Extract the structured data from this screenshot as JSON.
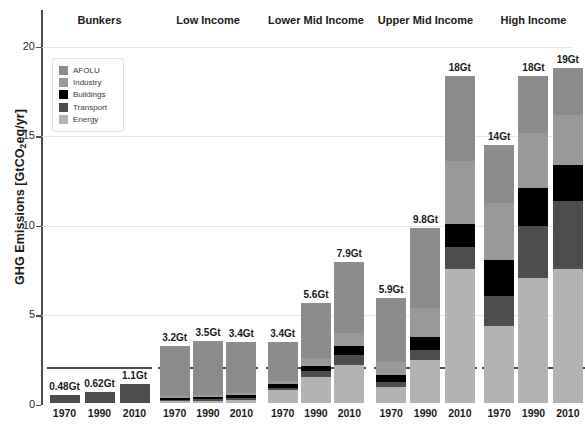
{
  "chart_data": {
    "type": "bar",
    "subtype": "stacked-grouped",
    "title": "",
    "xlabel": "",
    "ylabel": "GHG Emissions [GtCO2eq/yr]",
    "ylabel_parts": {
      "pre": "GHG Emissions [GtCO",
      "sub": "2",
      "post": "eq/yr]"
    },
    "ylim": [
      0,
      21.5
    ],
    "yticks": [
      0,
      5,
      10,
      15,
      20
    ],
    "ytick_labels": [
      "0",
      "5",
      "10",
      "15",
      "20"
    ],
    "grid": true,
    "legend_position": "upper-left-inside",
    "categories": [
      "1970",
      "1990",
      "2010"
    ],
    "series": [
      {
        "name": "Energy",
        "color": "#b3b3b3"
      },
      {
        "name": "Transport",
        "color": "#4d4d4d"
      },
      {
        "name": "Buildings",
        "color": "#000000"
      },
      {
        "name": "Industry",
        "color": "#999999"
      },
      {
        "name": "AFOLU",
        "color": "#8c8c8c"
      }
    ],
    "groups": [
      {
        "name": "Bunkers",
        "bars": [
          {
            "year": "1970",
            "total_label": "0.48Gt",
            "total": 0.48,
            "segments": [
              {
                "series": "Energy",
                "value": 0.0
              },
              {
                "series": "Transport",
                "value": 0.48
              },
              {
                "series": "Buildings",
                "value": 0.0
              },
              {
                "series": "Industry",
                "value": 0.0
              },
              {
                "series": "AFOLU",
                "value": 0.0
              }
            ]
          },
          {
            "year": "1990",
            "total_label": "0.62Gt",
            "total": 0.62,
            "segments": [
              {
                "series": "Energy",
                "value": 0.0
              },
              {
                "series": "Transport",
                "value": 0.62
              },
              {
                "series": "Buildings",
                "value": 0.0
              },
              {
                "series": "Industry",
                "value": 0.0
              },
              {
                "series": "AFOLU",
                "value": 0.0
              }
            ]
          },
          {
            "year": "2010",
            "total_label": "1.1Gt",
            "total": 1.1,
            "segments": [
              {
                "series": "Energy",
                "value": 0.0
              },
              {
                "series": "Transport",
                "value": 1.1
              },
              {
                "series": "Buildings",
                "value": 0.0
              },
              {
                "series": "Industry",
                "value": 0.0
              },
              {
                "series": "AFOLU",
                "value": 0.0
              }
            ]
          }
        ]
      },
      {
        "name": "Low Income",
        "bars": [
          {
            "year": "1970",
            "total_label": "3.2Gt",
            "total": 3.2,
            "segments": [
              {
                "series": "Energy",
                "value": 0.12
              },
              {
                "series": "Transport",
                "value": 0.08
              },
              {
                "series": "Buildings",
                "value": 0.1
              },
              {
                "series": "Industry",
                "value": 0.1
              },
              {
                "series": "AFOLU",
                "value": 2.8
              }
            ]
          },
          {
            "year": "1990",
            "total_label": "3.5Gt",
            "total": 3.5,
            "segments": [
              {
                "series": "Energy",
                "value": 0.14
              },
              {
                "series": "Transport",
                "value": 0.1
              },
              {
                "series": "Buildings",
                "value": 0.12
              },
              {
                "series": "Industry",
                "value": 0.12
              },
              {
                "series": "AFOLU",
                "value": 3.02
              }
            ]
          },
          {
            "year": "2010",
            "total_label": "3.4Gt",
            "total": 3.4,
            "segments": [
              {
                "series": "Energy",
                "value": 0.18
              },
              {
                "series": "Transport",
                "value": 0.12
              },
              {
                "series": "Buildings",
                "value": 0.14
              },
              {
                "series": "Industry",
                "value": 0.14
              },
              {
                "series": "AFOLU",
                "value": 2.82
              }
            ]
          }
        ]
      },
      {
        "name": "Lower Mid Income",
        "bars": [
          {
            "year": "1970",
            "total_label": "3.4Gt",
            "total": 3.4,
            "segments": [
              {
                "series": "Energy",
                "value": 0.75
              },
              {
                "series": "Transport",
                "value": 0.12
              },
              {
                "series": "Buildings",
                "value": 0.18
              },
              {
                "series": "Industry",
                "value": 0.2
              },
              {
                "series": "AFOLU",
                "value": 2.15
              }
            ]
          },
          {
            "year": "1990",
            "total_label": "5.6Gt",
            "total": 5.6,
            "segments": [
              {
                "series": "Energy",
                "value": 1.45
              },
              {
                "series": "Transport",
                "value": 0.35
              },
              {
                "series": "Buildings",
                "value": 0.3
              },
              {
                "series": "Industry",
                "value": 0.4
              },
              {
                "series": "AFOLU",
                "value": 3.1
              }
            ]
          },
          {
            "year": "2010",
            "total_label": "7.9Gt",
            "total": 7.9,
            "segments": [
              {
                "series": "Energy",
                "value": 2.15
              },
              {
                "series": "Transport",
                "value": 0.55
              },
              {
                "series": "Buildings",
                "value": 0.5
              },
              {
                "series": "Industry",
                "value": 0.7
              },
              {
                "series": "AFOLU",
                "value": 4.0
              }
            ]
          }
        ]
      },
      {
        "name": "Upper Mid Income",
        "bars": [
          {
            "year": "1970",
            "total_label": "5.9Gt",
            "total": 5.9,
            "segments": [
              {
                "series": "Energy",
                "value": 0.9
              },
              {
                "series": "Transport",
                "value": 0.3
              },
              {
                "series": "Buildings",
                "value": 0.35
              },
              {
                "series": "Industry",
                "value": 0.75
              },
              {
                "series": "AFOLU",
                "value": 3.6
              }
            ]
          },
          {
            "year": "1990",
            "total_label": "9.8Gt",
            "total": 9.8,
            "segments": [
              {
                "series": "Energy",
                "value": 2.4
              },
              {
                "series": "Transport",
                "value": 0.55
              },
              {
                "series": "Buildings",
                "value": 0.75
              },
              {
                "series": "Industry",
                "value": 1.6
              },
              {
                "series": "AFOLU",
                "value": 4.5
              }
            ]
          },
          {
            "year": "2010",
            "total_label": "18Gt",
            "total": 18.3,
            "segments": [
              {
                "series": "Energy",
                "value": 7.5
              },
              {
                "series": "Transport",
                "value": 1.2
              },
              {
                "series": "Buildings",
                "value": 1.3
              },
              {
                "series": "Industry",
                "value": 3.5
              },
              {
                "series": "AFOLU",
                "value": 4.8
              }
            ]
          }
        ]
      },
      {
        "name": "High Income",
        "bars": [
          {
            "year": "1970",
            "total_label": "14Gt",
            "total": 14.4,
            "segments": [
              {
                "series": "Energy",
                "value": 4.3
              },
              {
                "series": "Transport",
                "value": 1.7
              },
              {
                "series": "Buildings",
                "value": 2.0
              },
              {
                "series": "Industry",
                "value": 3.2
              },
              {
                "series": "AFOLU",
                "value": 3.2
              }
            ]
          },
          {
            "year": "1990",
            "total_label": "18Gt",
            "total": 18.3,
            "segments": [
              {
                "series": "Energy",
                "value": 7.0
              },
              {
                "series": "Transport",
                "value": 2.9
              },
              {
                "series": "Buildings",
                "value": 2.1
              },
              {
                "series": "Industry",
                "value": 3.1
              },
              {
                "series": "AFOLU",
                "value": 3.2
              }
            ]
          },
          {
            "year": "2010",
            "total_label": "19Gt",
            "total": 18.7,
            "segments": [
              {
                "series": "Energy",
                "value": 7.5
              },
              {
                "series": "Transport",
                "value": 3.8
              },
              {
                "series": "Buildings",
                "value": 2.0
              },
              {
                "series": "Industry",
                "value": 2.8
              },
              {
                "series": "AFOLU",
                "value": 2.6
              }
            ]
          }
        ]
      }
    ]
  },
  "legend": {
    "items": [
      {
        "label": "AFOLU",
        "color": "#8c8c8c"
      },
      {
        "label": "Industry",
        "color": "#999999"
      },
      {
        "label": "Buildings",
        "color": "#000000"
      },
      {
        "label": "Transport",
        "color": "#4d4d4d"
      },
      {
        "label": "Energy",
        "color": "#b3b3b3"
      }
    ]
  },
  "axis": {
    "title_pre": "GHG Emissions [GtCO",
    "title_sub": "2",
    "title_post": "eq/yr]"
  }
}
